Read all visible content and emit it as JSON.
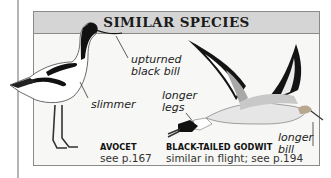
{
  "panel": {
    "title": "SIMILAR SPECIES"
  },
  "species": [
    {
      "name": "AVOCET",
      "reference": "see p.167",
      "annotations": [
        "upturned black bill",
        "slimmer"
      ]
    },
    {
      "name": "BLACK-TAILED GODWIT",
      "reference": "similar in flight; see p.194",
      "annotations": [
        "longer legs",
        "longer bill"
      ]
    }
  ],
  "labels": {
    "upturned": "upturned",
    "black_bill": "black bill",
    "slimmer": "slimmer",
    "longer_legs_1": "longer",
    "longer_legs_2": "legs",
    "longer_bill_1": "longer",
    "longer_bill_2": "bill"
  },
  "colors": {
    "header_bg": "#d5d5d5",
    "border": "#8a8a8a",
    "panel_bg": "#f7f7f5",
    "margin_rule": "#b4b4b4"
  }
}
